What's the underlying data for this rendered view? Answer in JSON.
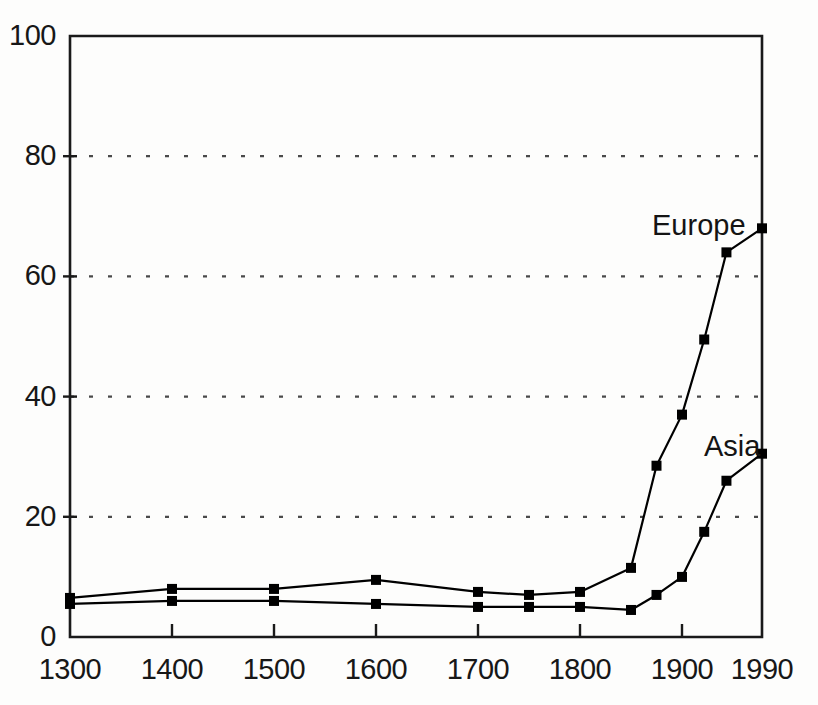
{
  "chart_data": {
    "type": "line",
    "title": "",
    "subtitle": "",
    "xlabel": "",
    "ylabel": "",
    "xlim": [
      1300,
      1990
    ],
    "ylim": [
      0,
      100
    ],
    "grid": "horizontal-dotted",
    "legend_position": "inline-annotation",
    "x_tick_labels": [
      "1300",
      "1400",
      "1500",
      "1600",
      "1700",
      "1800",
      "1900",
      "1990"
    ],
    "x_ticks": [
      1300,
      1400,
      1500,
      1600,
      1700,
      1800,
      1900,
      1990
    ],
    "y_tick_labels": [
      "0",
      "20",
      "40",
      "60",
      "80",
      "100"
    ],
    "y_ticks": [
      0,
      20,
      40,
      60,
      80,
      100
    ],
    "series": [
      {
        "name": "Europe",
        "marker": "square",
        "color": "#000000",
        "x": [
          1300,
          1400,
          1500,
          1600,
          1700,
          1750,
          1800,
          1850,
          1875,
          1900,
          1925,
          1950,
          1990
        ],
        "values": [
          6.5,
          8.0,
          8.0,
          9.5,
          7.5,
          7.0,
          7.5,
          11.5,
          28.5,
          37.0,
          49.5,
          64.0,
          68.0
        ]
      },
      {
        "name": "Asia",
        "marker": "square",
        "color": "#000000",
        "x": [
          1300,
          1400,
          1500,
          1600,
          1700,
          1750,
          1800,
          1850,
          1875,
          1900,
          1925,
          1950,
          1990
        ],
        "values": [
          5.5,
          6.0,
          6.0,
          5.5,
          5.0,
          5.0,
          5.0,
          4.5,
          7.0,
          10.0,
          17.5,
          26.0,
          30.5
        ]
      }
    ],
    "annotations": [
      {
        "text": "Europe",
        "series": "Europe",
        "x_px": 652,
        "y_px": 211
      },
      {
        "text": "Asia",
        "series": "Asia",
        "x_px": 704,
        "y_px": 432
      }
    ]
  },
  "axes": {
    "plot_left_px": 70,
    "plot_right_px": 762,
    "plot_top_px": 36,
    "plot_bottom_px": 637
  },
  "style": {
    "axis_color": "#1a1a1a",
    "grid_color": "#4a4a4a",
    "line_color": "#000000",
    "background": "#fdfdfc"
  }
}
